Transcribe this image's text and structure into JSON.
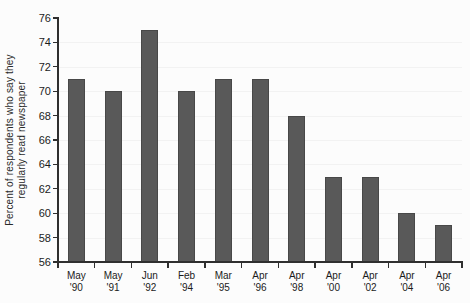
{
  "chart_data": {
    "type": "bar",
    "categories": [
      "May '90",
      "May '91",
      "Jun '92",
      "Feb '94",
      "Mar '95",
      "Apr '96",
      "Apr '98",
      "Apr '00",
      "Apr '02",
      "Apr '04",
      "Apr '06"
    ],
    "values": [
      71,
      70,
      75,
      70,
      71,
      71,
      68,
      63,
      63,
      60,
      59
    ],
    "title": "",
    "xlabel": "",
    "ylabel": "Percent of respondents who say they regularly read newspaper",
    "ylabel_lines": [
      "Percent of respondents who say they",
      "regularly read newspaper"
    ],
    "ylim": [
      56,
      76
    ],
    "yticks": [
      76,
      74,
      72,
      70,
      68,
      66,
      64,
      62,
      60,
      58,
      56
    ],
    "grid": "faint-horizontal",
    "legend": "none",
    "colors": {
      "bar": "#595959",
      "bar_border": "#484848",
      "axis": "#2f2f2f",
      "text": "#1b1b1b",
      "grid": "#f2f2f2",
      "background": "#fcfcfc"
    }
  }
}
